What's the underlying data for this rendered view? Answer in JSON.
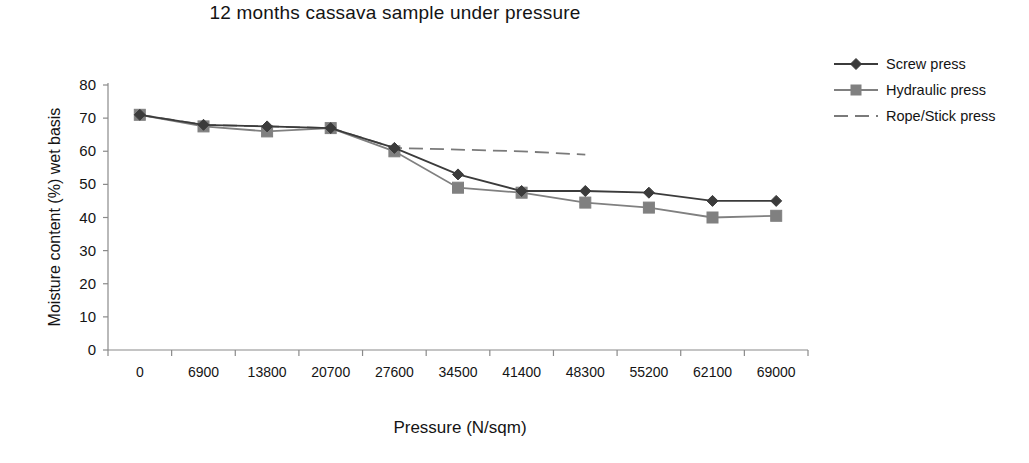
{
  "chart_data": {
    "type": "line",
    "title": "12 months cassava sample under pressure",
    "xlabel": "Pressure (N/sqm)",
    "ylabel": "Moisture content (%) wet basis",
    "categories": [
      "0",
      "6900",
      "13800",
      "20700",
      "27600",
      "34500",
      "41400",
      "48300",
      "55200",
      "62100",
      "69000"
    ],
    "ylim": [
      0,
      80
    ],
    "ytick_step": 10,
    "yticks": [
      "80",
      "70",
      "60",
      "50",
      "40",
      "30",
      "20",
      "10",
      "0"
    ],
    "grid": false,
    "legend_position": "right-top",
    "series": [
      {
        "name": "Screw press",
        "marker": "diamond",
        "color": "#3b3b3b",
        "line_style": "solid",
        "values": [
          71,
          68,
          67.5,
          67,
          61,
          53,
          48,
          48,
          47.5,
          45,
          45
        ]
      },
      {
        "name": "Hydraulic press",
        "marker": "square",
        "color": "#808080",
        "line_style": "solid",
        "values": [
          71,
          67.5,
          66,
          67,
          60,
          49,
          47.5,
          44.5,
          43,
          40,
          40.5
        ]
      },
      {
        "name": "Rope/Stick press",
        "marker": "none",
        "color": "#7a7a7a",
        "line_style": "dashed",
        "values": [
          71,
          68,
          67.5,
          67,
          61,
          60.5,
          60,
          59,
          null,
          null,
          null
        ]
      }
    ]
  },
  "legend": {
    "items": [
      {
        "label": "Screw press"
      },
      {
        "label": "Hydraulic press"
      },
      {
        "label": "Rope/Stick press"
      }
    ]
  }
}
